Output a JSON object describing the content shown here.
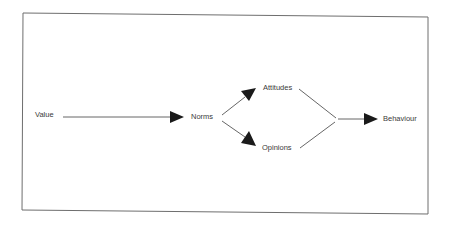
{
  "diagram": {
    "type": "flow",
    "nodes": [
      {
        "id": "value",
        "label": "Value"
      },
      {
        "id": "norms",
        "label": "Norms"
      },
      {
        "id": "attitudes",
        "label": "Attitudes"
      },
      {
        "id": "opinions",
        "label": "Opinions"
      },
      {
        "id": "behaviour",
        "label": "Behaviour"
      }
    ],
    "edges": [
      {
        "from": "value",
        "to": "norms",
        "arrow": true
      },
      {
        "from": "norms",
        "to": "attitudes",
        "arrow": true
      },
      {
        "from": "norms",
        "to": "opinions",
        "arrow": true
      },
      {
        "from": "attitudes",
        "to": "behaviour",
        "arrow": false,
        "merge": true
      },
      {
        "from": "opinions",
        "to": "behaviour",
        "arrow": false,
        "merge": true
      },
      {
        "from": "merge-point",
        "to": "behaviour",
        "arrow": true
      }
    ],
    "colors": {
      "line": "#555555",
      "arrowhead": "#1a1a1a",
      "border": "#6e6e6e",
      "text": "#3a3a3a"
    }
  }
}
